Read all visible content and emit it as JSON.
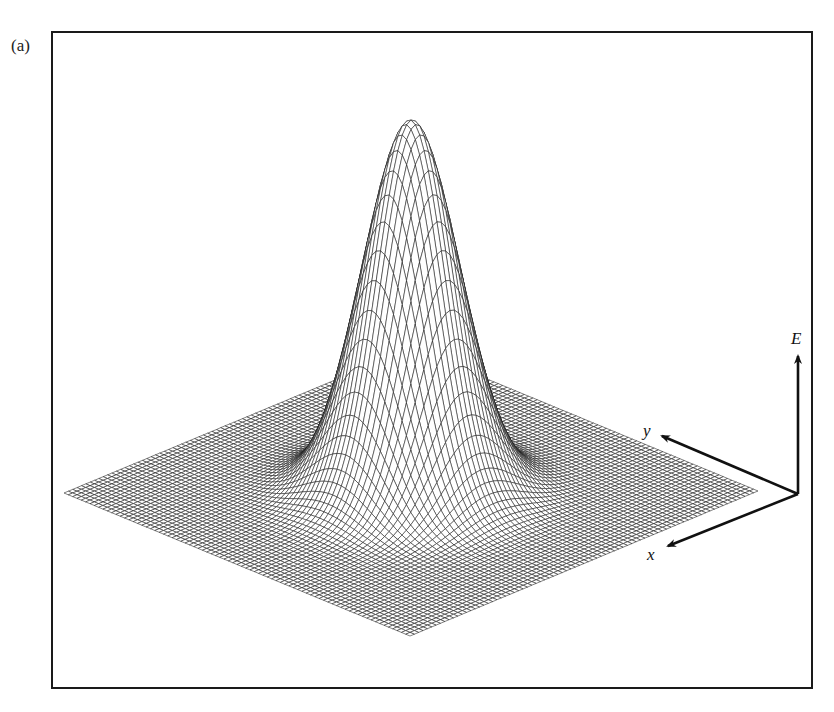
{
  "figure": {
    "panel_label": "(a)"
  },
  "axes": {
    "vertical_label": "E",
    "y_label": "y",
    "x_label": "x"
  },
  "chart_data": {
    "type": "surface",
    "title": "",
    "function": "E(x,y) = exp(-(x^2 + y^2) / (2*sigma^2))",
    "domain": {
      "x": [
        -1,
        1
      ],
      "y": [
        -1,
        1
      ]
    },
    "sigma": 0.2,
    "peak_value": 1,
    "grid_lines": 80,
    "axes_labels": {
      "x": "x",
      "y": "y",
      "z": "E"
    },
    "ticks": "none",
    "render": "wireframe mesh, black lines on white"
  },
  "projection": {
    "center": [
      411,
      492
    ],
    "x_axis_vec": [
      -174,
      72.5
    ],
    "y_axis_vec": [
      173,
      71.5
    ],
    "height_px": 372
  },
  "colors": {
    "mesh": "#1a1a1a",
    "frame": "#1a1a1a",
    "background": "#ffffff"
  }
}
